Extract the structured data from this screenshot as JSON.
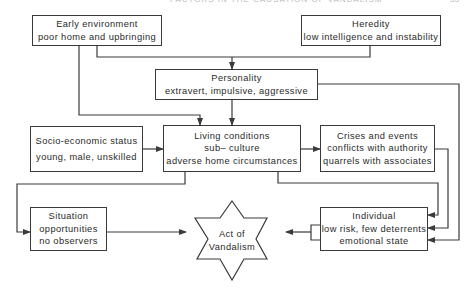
{
  "page_header": {
    "running_title": "FACTORS IN THE CAUSATION OF VANDALISM",
    "page_number": "33"
  },
  "nodes": {
    "early_environment": {
      "title": "Early environment",
      "lines": [
        "poor home and upbringing"
      ]
    },
    "heredity": {
      "title": "Heredity",
      "lines": [
        "low intelligence and instability"
      ]
    },
    "personality": {
      "title": "Personality",
      "lines": [
        "extravert, impulsive, aggressive"
      ]
    },
    "socio_economic": {
      "title": "Socio-economic status",
      "lines": [
        "young,  male, unskilled"
      ]
    },
    "living_conditions": {
      "title": "Living conditions",
      "lines": [
        "sub– culture",
        "adverse home circumstances"
      ]
    },
    "crises_events": {
      "title": "Crises and events",
      "lines": [
        "conflicts with authority",
        "quarrels with associates"
      ]
    },
    "situation": {
      "title": "Situation",
      "lines": [
        "opportunities",
        "no observers"
      ]
    },
    "individual": {
      "title": "Individual",
      "lines": [
        "low risk, few deterrents",
        "emotional state"
      ]
    },
    "act_of_vandalism": {
      "title": "Act of",
      "lines": [
        "Vandalism"
      ],
      "shape": "six-pointed-star"
    }
  },
  "edges": [
    {
      "from": "early_environment",
      "to": "personality"
    },
    {
      "from": "heredity",
      "to": "personality"
    },
    {
      "from": "early_environment",
      "to": "living_conditions"
    },
    {
      "from": "personality",
      "to": "living_conditions"
    },
    {
      "from": "socio_economic",
      "to": "living_conditions"
    },
    {
      "from": "living_conditions",
      "to": "crises_events"
    },
    {
      "from": "living_conditions",
      "to": "situation"
    },
    {
      "from": "living_conditions",
      "to": "individual"
    },
    {
      "from": "crises_events",
      "to": "individual"
    },
    {
      "from": "personality",
      "to": "individual"
    },
    {
      "from": "situation",
      "to": "act_of_vandalism"
    },
    {
      "from": "individual",
      "to": "act_of_vandalism"
    }
  ],
  "colors": {
    "line": "#3a3a3a",
    "background": "#ffffff",
    "text": "#2a2a2a"
  }
}
